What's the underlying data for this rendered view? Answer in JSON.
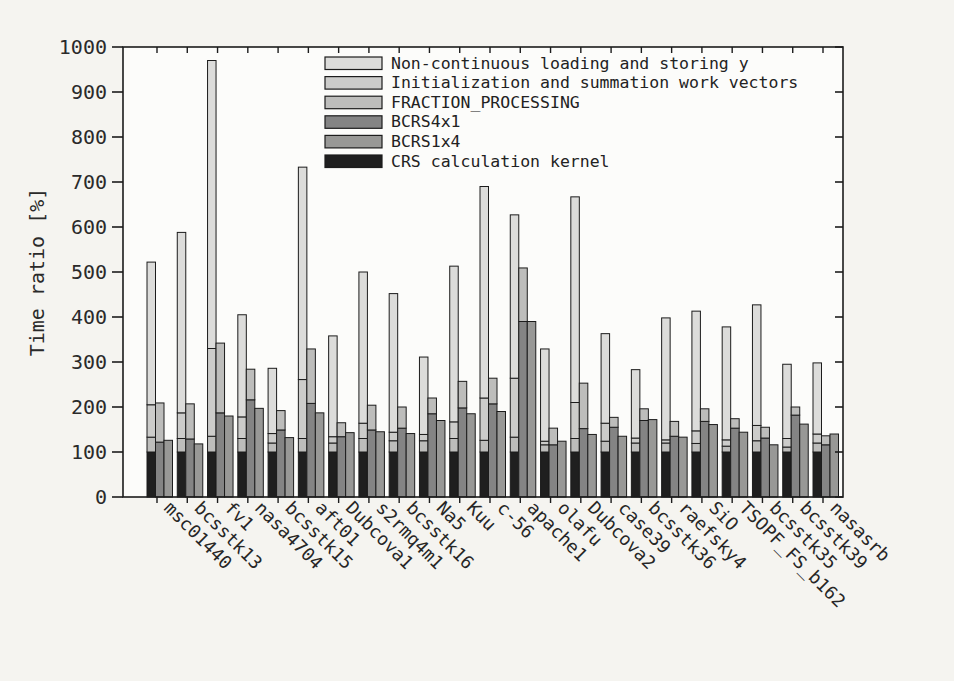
{
  "figure": {
    "background": "#f5f4f0",
    "plot_background": "#fcfcfa",
    "axis_color": "#1c1c1c"
  },
  "chart_data": {
    "type": "bar",
    "title": "",
    "xlabel": "",
    "ylabel": "Time ratio [%]",
    "ylim": [
      0,
      1000
    ],
    "ytick_step": 100,
    "yticks": [
      0,
      100,
      200,
      300,
      400,
      500,
      600,
      700,
      800,
      900,
      1000
    ],
    "grid": false,
    "legend_position": "top-inside",
    "legend": [
      {
        "label": "Non-continuous loading and storing y",
        "color": "#dcdcda",
        "key": "noncont"
      },
      {
        "label": "Initialization and summation work vectors",
        "color": "#ccccca",
        "key": "init"
      },
      {
        "label": "FRACTION_PROCESSING",
        "color": "#bdbdbb",
        "key": "fraction"
      },
      {
        "label": "BCRS4x1",
        "color": "#848484",
        "key": "bcrs4x1"
      },
      {
        "label": "BCRS1x4",
        "color": "#989896",
        "key": "bcrs1x4"
      },
      {
        "label": "CRS calculation kernel",
        "color": "#1f1f1f",
        "key": "crs"
      }
    ],
    "bars_per_group": [
      "crs_stack",
      "bcrs4x1_stack",
      "bcrs1x4_stack"
    ],
    "note": "values are cumulative segment tops in percent; crs stack = kernel/fraction/init/total(noncont top); bcrs stacks = kernel(dark)/total(light fraction top)",
    "categories": [
      "msc01440",
      "bcsstk13",
      "fv1",
      "nasa4704",
      "bcsstk15",
      "aft01",
      "Dubcova1",
      "s2rmq4m1",
      "bcsstk16",
      "Na5",
      "Kuu",
      "c-56",
      "apache1",
      "olafu",
      "Dubcova2",
      "case39",
      "bcsstk36",
      "raefsky4",
      "SiO",
      "TSOPF_FS_b162",
      "bcsstk35",
      "bcsstk39",
      "nasasrb"
    ],
    "groups": [
      {
        "name": "msc01440",
        "crs": {
          "kernel": 100,
          "fraction": 133,
          "init": 205,
          "total": 522
        },
        "bcrs4x1": {
          "kernel": 122,
          "total": 209
        },
        "bcrs1x4": {
          "kernel": 126,
          "total": 126
        }
      },
      {
        "name": "bcsstk13",
        "crs": {
          "kernel": 100,
          "fraction": 130,
          "init": 187,
          "total": 588
        },
        "bcrs4x1": {
          "kernel": 129,
          "total": 207
        },
        "bcrs1x4": {
          "kernel": 118,
          "total": 118
        }
      },
      {
        "name": "fv1",
        "crs": {
          "kernel": 100,
          "fraction": 135,
          "init": 330,
          "total": 970
        },
        "bcrs4x1": {
          "kernel": 187,
          "total": 342
        },
        "bcrs1x4": {
          "kernel": 180,
          "total": 180
        }
      },
      {
        "name": "nasa4704",
        "crs": {
          "kernel": 100,
          "fraction": 130,
          "init": 178,
          "total": 405
        },
        "bcrs4x1": {
          "kernel": 216,
          "total": 284
        },
        "bcrs1x4": {
          "kernel": 197,
          "total": 197
        }
      },
      {
        "name": "bcsstk15",
        "crs": {
          "kernel": 100,
          "fraction": 120,
          "init": 141,
          "total": 286
        },
        "bcrs4x1": {
          "kernel": 149,
          "total": 192
        },
        "bcrs1x4": {
          "kernel": 132,
          "total": 132
        }
      },
      {
        "name": "aft01",
        "crs": {
          "kernel": 100,
          "fraction": 130,
          "init": 261,
          "total": 733
        },
        "bcrs4x1": {
          "kernel": 208,
          "total": 329
        },
        "bcrs1x4": {
          "kernel": 187,
          "total": 187
        }
      },
      {
        "name": "Dubcova1",
        "crs": {
          "kernel": 100,
          "fraction": 120,
          "init": 134,
          "total": 358
        },
        "bcrs4x1": {
          "kernel": 134,
          "total": 165
        },
        "bcrs1x4": {
          "kernel": 143,
          "total": 143
        }
      },
      {
        "name": "s2rmq4m1",
        "crs": {
          "kernel": 100,
          "fraction": 130,
          "init": 164,
          "total": 500
        },
        "bcrs4x1": {
          "kernel": 149,
          "total": 204
        },
        "bcrs1x4": {
          "kernel": 145,
          "total": 145
        }
      },
      {
        "name": "bcsstk16",
        "crs": {
          "kernel": 100,
          "fraction": 125,
          "init": 144,
          "total": 452
        },
        "bcrs4x1": {
          "kernel": 153,
          "total": 200
        },
        "bcrs1x4": {
          "kernel": 141,
          "total": 141
        }
      },
      {
        "name": "Na5",
        "crs": {
          "kernel": 100,
          "fraction": 125,
          "init": 139,
          "total": 311
        },
        "bcrs4x1": {
          "kernel": 185,
          "total": 220
        },
        "bcrs1x4": {
          "kernel": 170,
          "total": 170
        }
      },
      {
        "name": "Kuu",
        "crs": {
          "kernel": 100,
          "fraction": 130,
          "init": 167,
          "total": 513
        },
        "bcrs4x1": {
          "kernel": 198,
          "total": 257
        },
        "bcrs1x4": {
          "kernel": 185,
          "total": 185
        }
      },
      {
        "name": "c-56",
        "crs": {
          "kernel": 100,
          "fraction": 126,
          "init": 220,
          "total": 690
        },
        "bcrs4x1": {
          "kernel": 207,
          "total": 264
        },
        "bcrs1x4": {
          "kernel": 190,
          "total": 190
        }
      },
      {
        "name": "apache1",
        "crs": {
          "kernel": 100,
          "fraction": 133,
          "init": 264,
          "total": 627
        },
        "bcrs4x1": {
          "kernel": 390,
          "total": 509
        },
        "bcrs1x4": {
          "kernel": 390,
          "total": 390
        }
      },
      {
        "name": "olafu",
        "crs": {
          "kernel": 100,
          "fraction": 116,
          "init": 124,
          "total": 329
        },
        "bcrs4x1": {
          "kernel": 116,
          "total": 153
        },
        "bcrs1x4": {
          "kernel": 124,
          "total": 124
        }
      },
      {
        "name": "Dubcova2",
        "crs": {
          "kernel": 100,
          "fraction": 130,
          "init": 210,
          "total": 667
        },
        "bcrs4x1": {
          "kernel": 152,
          "total": 253
        },
        "bcrs1x4": {
          "kernel": 139,
          "total": 139
        }
      },
      {
        "name": "case39",
        "crs": {
          "kernel": 100,
          "fraction": 124,
          "init": 164,
          "total": 363
        },
        "bcrs4x1": {
          "kernel": 155,
          "total": 177
        },
        "bcrs1x4": {
          "kernel": 135,
          "total": 135
        }
      },
      {
        "name": "bcsstk36",
        "crs": {
          "kernel": 100,
          "fraction": 120,
          "init": 131,
          "total": 283
        },
        "bcrs4x1": {
          "kernel": 170,
          "total": 196
        },
        "bcrs1x4": {
          "kernel": 172,
          "total": 172
        }
      },
      {
        "name": "raefsky4",
        "crs": {
          "kernel": 100,
          "fraction": 120,
          "init": 127,
          "total": 398
        },
        "bcrs4x1": {
          "kernel": 135,
          "total": 168
        },
        "bcrs1x4": {
          "kernel": 133,
          "total": 133
        }
      },
      {
        "name": "SiO",
        "crs": {
          "kernel": 100,
          "fraction": 119,
          "init": 147,
          "total": 413
        },
        "bcrs4x1": {
          "kernel": 168,
          "total": 196
        },
        "bcrs1x4": {
          "kernel": 161,
          "total": 161
        }
      },
      {
        "name": "TSOPF_FS_b162",
        "crs": {
          "kernel": 100,
          "fraction": 113,
          "init": 127,
          "total": 378
        },
        "bcrs4x1": {
          "kernel": 153,
          "total": 174
        },
        "bcrs1x4": {
          "kernel": 144,
          "total": 144
        }
      },
      {
        "name": "bcsstk35",
        "crs": {
          "kernel": 100,
          "fraction": 125,
          "init": 159,
          "total": 427
        },
        "bcrs4x1": {
          "kernel": 131,
          "total": 155
        },
        "bcrs1x4": {
          "kernel": 116,
          "total": 116
        }
      },
      {
        "name": "bcsstk39",
        "crs": {
          "kernel": 100,
          "fraction": 111,
          "init": 130,
          "total": 295
        },
        "bcrs4x1": {
          "kernel": 182,
          "total": 200
        },
        "bcrs1x4": {
          "kernel": 162,
          "total": 162
        }
      },
      {
        "name": "nasasrb",
        "crs": {
          "kernel": 100,
          "fraction": 120,
          "init": 140,
          "total": 298
        },
        "bcrs4x1": {
          "kernel": 116,
          "total": 136
        },
        "bcrs1x4": {
          "kernel": 140,
          "total": 140
        }
      }
    ]
  }
}
